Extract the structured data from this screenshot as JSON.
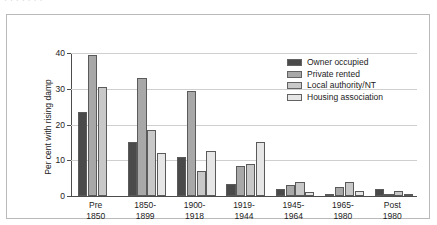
{
  "top_caption": {
    "text": "·         ·    ·    ·                 ·        ·  ·"
  },
  "chart_data": {
    "type": "bar",
    "title": "",
    "subtitle": "",
    "xlabel": "",
    "ylabel": "Per cent with rising damp",
    "ylim": [
      0,
      40
    ],
    "yticks": [
      0,
      10,
      20,
      30,
      40
    ],
    "ytick_labels": [
      "0",
      "10",
      "20",
      "30",
      "40"
    ],
    "grid": true,
    "grid_axis": "y",
    "legend_position": "upper-right-inside",
    "categories": [
      "Pre 1850",
      "1850-1899",
      "1900-1918",
      "1919-1944",
      "1945-1964",
      "1965-1980",
      "Post 1980"
    ],
    "category_lines": [
      [
        "Pre",
        "1850"
      ],
      [
        "1850-",
        "1899"
      ],
      [
        "1900-",
        "1918"
      ],
      [
        "1919-",
        "1944"
      ],
      [
        "1945-",
        "1964"
      ],
      [
        "1965-",
        "1980"
      ],
      [
        "Post",
        "1980"
      ]
    ],
    "series": [
      {
        "name": "Owner occupied",
        "color": "#4a4a4a",
        "values": [
          23.5,
          15.0,
          11.0,
          3.5,
          2.0,
          0.5,
          2.0
        ]
      },
      {
        "name": "Private rented",
        "color": "#a8a8a8",
        "values": [
          39.5,
          33.0,
          29.5,
          8.5,
          3.0,
          2.5,
          0.3
        ]
      },
      {
        "name": "Local authority/NT",
        "color": "#c8c8c8",
        "values": [
          30.5,
          18.5,
          7.0,
          9.0,
          4.0,
          4.0,
          1.5
        ]
      },
      {
        "name": "Housing association",
        "color": "#e6e6e6",
        "values": [
          null,
          12.0,
          12.5,
          15.0,
          1.0,
          1.5,
          0.3
        ]
      }
    ]
  },
  "legend": {
    "entries": [
      {
        "label": "Owner occupied",
        "color": "#4a4a4a"
      },
      {
        "label": "Private rented",
        "color": "#a8a8a8"
      },
      {
        "label": "Local authority/NT",
        "color": "#c8c8c8"
      },
      {
        "label": "Housing association",
        "color": "#e6e6e6"
      }
    ]
  }
}
